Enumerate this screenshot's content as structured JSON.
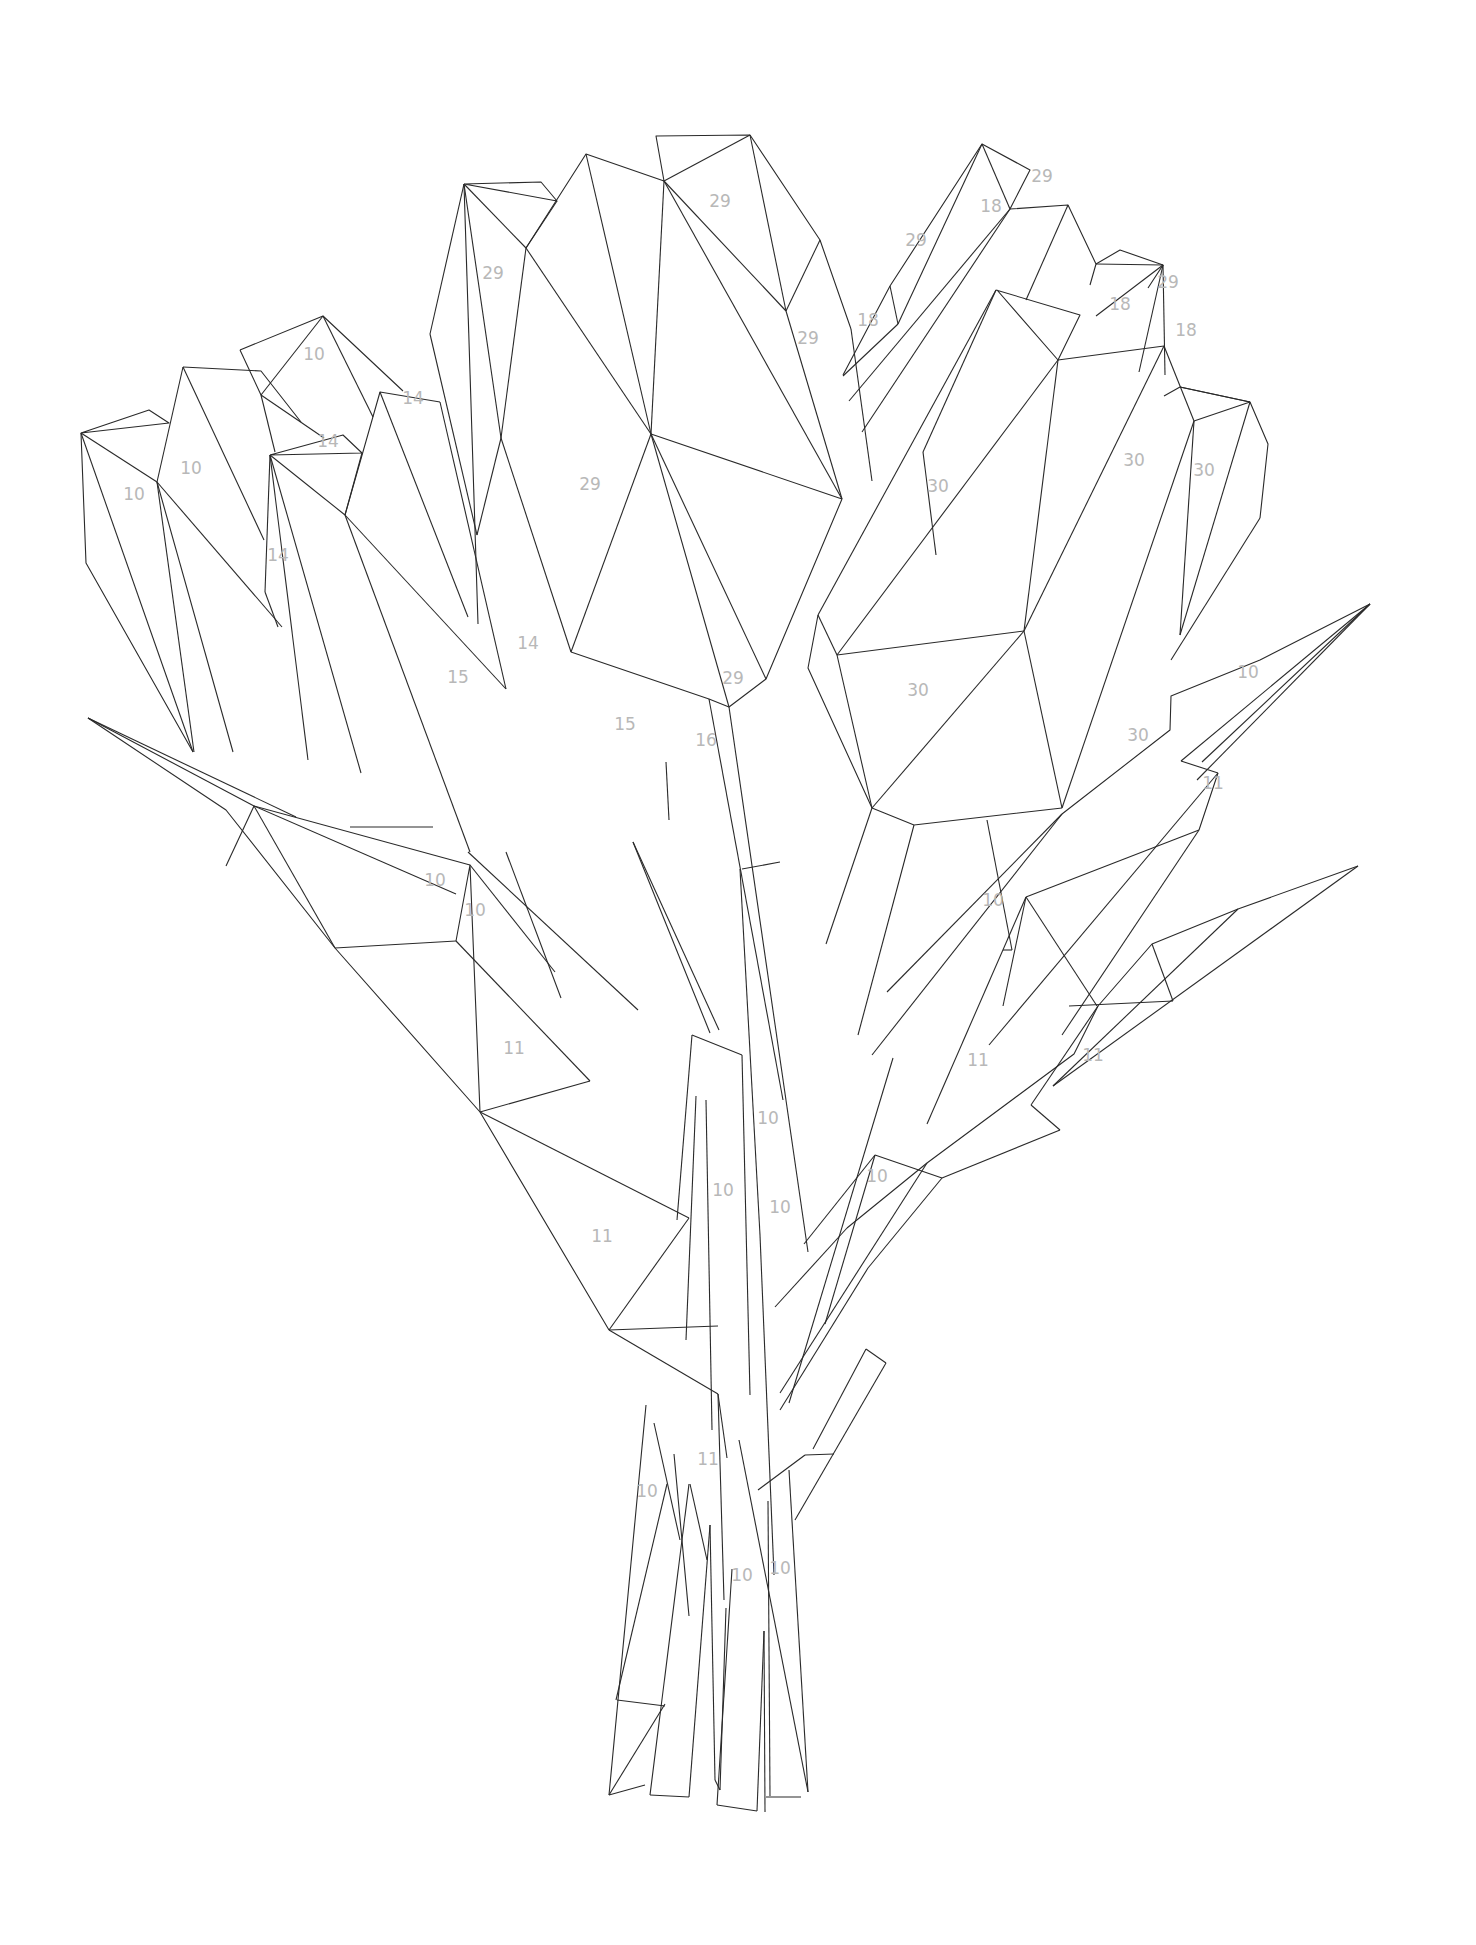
{
  "artwork": {
    "title": "Geometric tulip bouquet paint-by-number",
    "line_color": "#2a2a2a",
    "label_color": "#b8b8b8",
    "background": "#ffffff"
  },
  "labels": [
    {
      "text": "10",
      "x": 314,
      "y": 354
    },
    {
      "text": "10",
      "x": 191,
      "y": 468
    },
    {
      "text": "10",
      "x": 134,
      "y": 494
    },
    {
      "text": "14",
      "x": 413,
      "y": 398
    },
    {
      "text": "14",
      "x": 328,
      "y": 441
    },
    {
      "text": "14",
      "x": 278,
      "y": 555
    },
    {
      "text": "29",
      "x": 493,
      "y": 273
    },
    {
      "text": "29",
      "x": 720,
      "y": 201
    },
    {
      "text": "29",
      "x": 808,
      "y": 338
    },
    {
      "text": "29",
      "x": 590,
      "y": 484
    },
    {
      "text": "29",
      "x": 916,
      "y": 240
    },
    {
      "text": "18",
      "x": 991,
      "y": 206
    },
    {
      "text": "29",
      "x": 1042,
      "y": 176
    },
    {
      "text": "18",
      "x": 868,
      "y": 320
    },
    {
      "text": "18",
      "x": 1120,
      "y": 304
    },
    {
      "text": "29",
      "x": 1168,
      "y": 282
    },
    {
      "text": "18",
      "x": 1186,
      "y": 330
    },
    {
      "text": "30",
      "x": 938,
      "y": 486
    },
    {
      "text": "30",
      "x": 1134,
      "y": 460
    },
    {
      "text": "30",
      "x": 1204,
      "y": 470
    },
    {
      "text": "14",
      "x": 528,
      "y": 643
    },
    {
      "text": "15",
      "x": 458,
      "y": 677
    },
    {
      "text": "15",
      "x": 625,
      "y": 724
    },
    {
      "text": "29",
      "x": 733,
      "y": 678
    },
    {
      "text": "16",
      "x": 706,
      "y": 740
    },
    {
      "text": "30",
      "x": 918,
      "y": 690
    },
    {
      "text": "30",
      "x": 1138,
      "y": 735
    },
    {
      "text": "10",
      "x": 1248,
      "y": 672
    },
    {
      "text": "11",
      "x": 1213,
      "y": 783
    },
    {
      "text": "10",
      "x": 435,
      "y": 880
    },
    {
      "text": "10",
      "x": 475,
      "y": 910
    },
    {
      "text": "10",
      "x": 993,
      "y": 900
    },
    {
      "text": "11",
      "x": 514,
      "y": 1048
    },
    {
      "text": "11",
      "x": 978,
      "y": 1060
    },
    {
      "text": "11",
      "x": 1093,
      "y": 1055
    },
    {
      "text": "10",
      "x": 768,
      "y": 1118
    },
    {
      "text": "10",
      "x": 723,
      "y": 1190
    },
    {
      "text": "10",
      "x": 780,
      "y": 1207
    },
    {
      "text": "10",
      "x": 877,
      "y": 1176
    },
    {
      "text": "11",
      "x": 602,
      "y": 1236
    },
    {
      "text": "11",
      "x": 708,
      "y": 1459
    },
    {
      "text": "10",
      "x": 647,
      "y": 1491
    },
    {
      "text": "10",
      "x": 742,
      "y": 1575
    },
    {
      "text": "10",
      "x": 780,
      "y": 1568
    }
  ]
}
